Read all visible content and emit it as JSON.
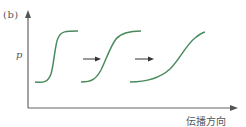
{
  "figure": {
    "panel_label": "(b)",
    "y_axis_label": "p",
    "x_axis_label": "伝播方向",
    "colors": {
      "axis": "#666666",
      "curve": "#4a8a5c",
      "arrow": "#333333",
      "text": "#555555"
    },
    "curves": [
      {
        "name": "waveform-1",
        "steepness": "steep"
      },
      {
        "name": "waveform-2",
        "steepness": "medium"
      },
      {
        "name": "waveform-3",
        "steepness": "gentle"
      }
    ],
    "arrows_between_curves": 2
  }
}
